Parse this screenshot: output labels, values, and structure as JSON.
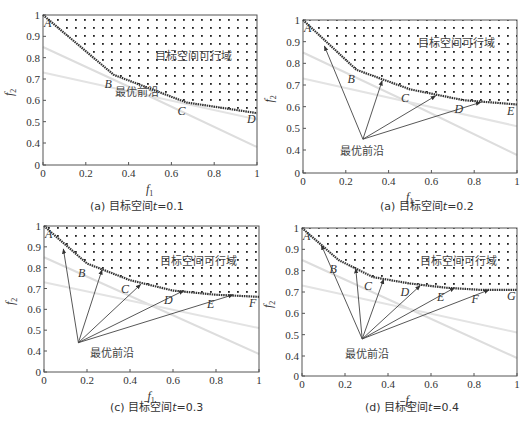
{
  "figure": {
    "panels": [
      {
        "id": "a",
        "caption_prefix": "(a)",
        "caption_text": "目标空间",
        "caption_var": "t",
        "caption_value": "=0.1"
      },
      {
        "id": "b",
        "caption_prefix": "(a)",
        "caption_text": "目标空间",
        "caption_var": "t",
        "caption_value": "=0.2"
      },
      {
        "id": "c",
        "caption_prefix": "(c)",
        "caption_text": "目标空间",
        "caption_var": "t",
        "caption_value": "=0.3"
      },
      {
        "id": "d",
        "caption_prefix": "(d)",
        "caption_text": "目标空间",
        "caption_var": "t",
        "caption_value": "=0.4"
      }
    ],
    "region_label": "目标空间可行域",
    "front_label": "最优前沿",
    "xlabel": "f",
    "xlabel_sub": "1",
    "ylabel": "f",
    "ylabel_sub": "2",
    "xticks": [
      "0",
      "0.2",
      "0.4",
      "0.6",
      "0.8",
      "1"
    ],
    "yticks": [
      "1",
      "0.9",
      "0.8",
      "0.7",
      "0.6",
      "0.5",
      "0.4",
      "0"
    ]
  },
  "chart_data": [
    {
      "type": "line",
      "title": "(a) 目标空间t=0.1",
      "xlabel": "f1",
      "ylabel": "f2",
      "xlim": [
        0,
        1
      ],
      "ylim": [
        0,
        1
      ],
      "y_axis_break": "ticks 1..0.4 linear, then 0 shown below",
      "regions": [
        {
          "name": "目标空间可行域",
          "fill": "dotted",
          "bounded_by": "pareto_front_to_top"
        }
      ],
      "series": [
        {
          "name": "Pareto front",
          "x": [
            0,
            0.33,
            0.67,
            1.0
          ],
          "y": [
            1.0,
            0.72,
            0.59,
            0.54
          ]
        }
      ],
      "points": [
        {
          "label": "A",
          "x": 0,
          "y": 1.0
        },
        {
          "label": "B",
          "x": 0.33,
          "y": 0.72
        },
        {
          "label": "C",
          "x": 0.67,
          "y": 0.59
        },
        {
          "label": "D",
          "x": 1.0,
          "y": 0.54
        }
      ],
      "annotations": [
        "目标空间可行域",
        "最优前沿"
      ],
      "arrows": []
    },
    {
      "type": "line",
      "title": "(a) 目标空间t=0.2",
      "xlabel": "f1",
      "ylabel": "f2",
      "xlim": [
        0,
        1
      ],
      "ylim": [
        0,
        1
      ],
      "series": [
        {
          "name": "Pareto front",
          "x": [
            0,
            0.25,
            0.5,
            0.75,
            1.0
          ],
          "y": [
            1.0,
            0.77,
            0.68,
            0.63,
            0.61
          ]
        }
      ],
      "points": [
        {
          "label": "A",
          "x": 0,
          "y": 1.0
        },
        {
          "label": "B",
          "x": 0.25,
          "y": 0.77
        },
        {
          "label": "C",
          "x": 0.5,
          "y": 0.68
        },
        {
          "label": "D",
          "x": 0.75,
          "y": 0.63
        },
        {
          "label": "E",
          "x": 1.0,
          "y": 0.61
        }
      ],
      "annotations": [
        "目标空间可行域",
        "最优前沿"
      ],
      "arrows": [
        {
          "from": [
            0.28,
            0.45
          ],
          "to": [
            0.1,
            0.88
          ]
        },
        {
          "from": [
            0.28,
            0.45
          ],
          "to": [
            0.37,
            0.72
          ]
        },
        {
          "from": [
            0.28,
            0.45
          ],
          "to": [
            0.62,
            0.65
          ]
        },
        {
          "from": [
            0.28,
            0.45
          ],
          "to": [
            0.83,
            0.62
          ]
        }
      ]
    },
    {
      "type": "line",
      "title": "(c) 目标空间t=0.3",
      "xlabel": "f1",
      "ylabel": "f2",
      "xlim": [
        0,
        1
      ],
      "ylim": [
        0,
        1
      ],
      "series": [
        {
          "name": "Pareto front",
          "x": [
            0,
            0.2,
            0.4,
            0.6,
            0.8,
            1.0
          ],
          "y": [
            1.0,
            0.82,
            0.74,
            0.69,
            0.67,
            0.66
          ]
        }
      ],
      "points": [
        {
          "label": "A",
          "x": 0,
          "y": 1.0
        },
        {
          "label": "B",
          "x": 0.2,
          "y": 0.82
        },
        {
          "label": "C",
          "x": 0.4,
          "y": 0.74
        },
        {
          "label": "D",
          "x": 0.6,
          "y": 0.69
        },
        {
          "label": "E",
          "x": 0.8,
          "y": 0.67
        },
        {
          "label": "F",
          "x": 1.0,
          "y": 0.66
        }
      ],
      "annotations": [
        "目标空间可行域",
        "最优前沿"
      ],
      "arrows": [
        {
          "from": [
            0.16,
            0.44
          ],
          "to": [
            0.09,
            0.89
          ]
        },
        {
          "from": [
            0.16,
            0.44
          ],
          "to": [
            0.27,
            0.79
          ]
        },
        {
          "from": [
            0.16,
            0.44
          ],
          "to": [
            0.45,
            0.72
          ]
        },
        {
          "from": [
            0.16,
            0.44
          ],
          "to": [
            0.65,
            0.69
          ]
        },
        {
          "from": [
            0.16,
            0.44
          ],
          "to": [
            0.88,
            0.67
          ]
        }
      ]
    },
    {
      "type": "line",
      "title": "(d) 目标空间t=0.4",
      "xlabel": "f1",
      "ylabel": "f2",
      "xlim": [
        0,
        1
      ],
      "ylim": [
        0,
        1
      ],
      "series": [
        {
          "name": "Pareto front",
          "x": [
            0,
            0.17,
            0.33,
            0.5,
            0.67,
            0.83,
            1.0
          ],
          "y": [
            1.0,
            0.85,
            0.77,
            0.74,
            0.72,
            0.71,
            0.71
          ]
        }
      ],
      "points": [
        {
          "label": "A",
          "x": 0,
          "y": 1.0
        },
        {
          "label": "B",
          "x": 0.17,
          "y": 0.85
        },
        {
          "label": "C",
          "x": 0.33,
          "y": 0.77
        },
        {
          "label": "D",
          "x": 0.5,
          "y": 0.74
        },
        {
          "label": "E",
          "x": 0.67,
          "y": 0.72
        },
        {
          "label": "F",
          "x": 0.83,
          "y": 0.71
        },
        {
          "label": "G",
          "x": 1.0,
          "y": 0.71
        }
      ],
      "annotations": [
        "目标空间可行域",
        "最优前沿"
      ],
      "arrows": [
        {
          "from": [
            0.28,
            0.48
          ],
          "to": [
            0.09,
            0.92
          ]
        },
        {
          "from": [
            0.28,
            0.48
          ],
          "to": [
            0.25,
            0.81
          ]
        },
        {
          "from": [
            0.28,
            0.48
          ],
          "to": [
            0.38,
            0.76
          ]
        },
        {
          "from": [
            0.28,
            0.48
          ],
          "to": [
            0.55,
            0.73
          ]
        },
        {
          "from": [
            0.28,
            0.48
          ],
          "to": [
            0.71,
            0.72
          ]
        },
        {
          "from": [
            0.28,
            0.48
          ],
          "to": [
            0.87,
            0.71
          ]
        }
      ]
    }
  ]
}
